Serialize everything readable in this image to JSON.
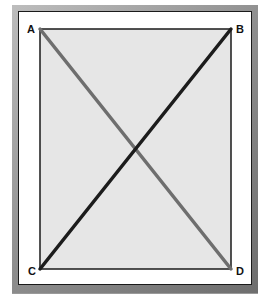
{
  "diagram": {
    "type": "rectangle-with-diagonals",
    "vertices": [
      {
        "id": "A",
        "label": "A",
        "x": 40,
        "y": 29
      },
      {
        "id": "B",
        "label": "B",
        "x": 231,
        "y": 29
      },
      {
        "id": "C",
        "label": "C",
        "x": 40,
        "y": 269
      },
      {
        "id": "D",
        "label": "D",
        "x": 231,
        "y": 269
      }
    ],
    "edges": [
      {
        "from": "A",
        "to": "D",
        "color": "#6e6e6e",
        "width": 3.5
      },
      {
        "from": "C",
        "to": "B",
        "color": "#1c1c1c",
        "width": 3.5
      }
    ],
    "colors": {
      "rect_fill": "#e6e6e6",
      "rect_stroke": "#1a1a1a",
      "frame": "#8e8e8e",
      "mat": "#ffffff"
    }
  },
  "labels": {
    "a": "A",
    "b": "B",
    "c": "C",
    "d": "D"
  }
}
